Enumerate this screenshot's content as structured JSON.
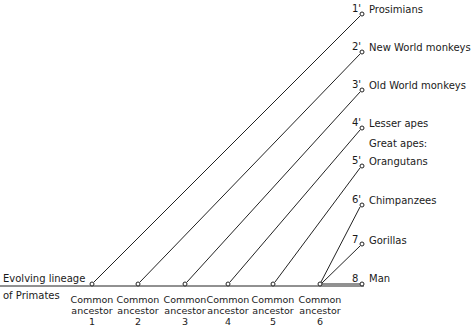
{
  "diagram": {
    "baseline_label": [
      "Evolving lineage",
      "of Primates"
    ],
    "ancestors": [
      {
        "line1": "Common",
        "line2": "ancestor",
        "num": "1",
        "x": 92
      },
      {
        "line1": "Common",
        "line2": "ancestor",
        "num": "2",
        "x": 138
      },
      {
        "line1": "Common",
        "line2": "ancestor",
        "num": "3",
        "x": 185
      },
      {
        "line1": "Common",
        "line2": "ancestor",
        "num": "4",
        "x": 228
      },
      {
        "line1": "Common",
        "line2": "ancestor",
        "num": "5",
        "x": 273
      },
      {
        "line1": "Common",
        "line2": "ancestor",
        "num": "6",
        "x": 320
      }
    ],
    "group_heading": "Great apes:",
    "tips": [
      {
        "num": "1'",
        "label": "Prosimians",
        "from_ancestor": 1,
        "y": 14
      },
      {
        "num": "2'",
        "label": "New World monkeys",
        "from_ancestor": 2,
        "y": 52
      },
      {
        "num": "3'",
        "label": "Old World monkeys",
        "from_ancestor": 3,
        "y": 90
      },
      {
        "num": "4'",
        "label": "Lesser apes",
        "from_ancestor": 4,
        "y": 128
      },
      {
        "num": "5'",
        "label": "Orangutans",
        "from_ancestor": 5,
        "y": 166
      },
      {
        "num": "6'",
        "label": "Chimpanzees",
        "from_ancestor": 6,
        "y": 205
      },
      {
        "num": "7",
        "label": "Gorillas",
        "from_ancestor": 6,
        "y": 244
      },
      {
        "num": "8",
        "label": "Man",
        "from_ancestor": 6,
        "y": 285
      }
    ],
    "colors": {
      "line": "#222222",
      "text": "#1a1a1a",
      "background": "#ffffff"
    }
  }
}
